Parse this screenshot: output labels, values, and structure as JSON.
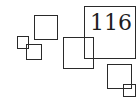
{
  "figure": {
    "label": "116",
    "stroke_color": "#2a2a2a",
    "background": "#ffffff"
  }
}
